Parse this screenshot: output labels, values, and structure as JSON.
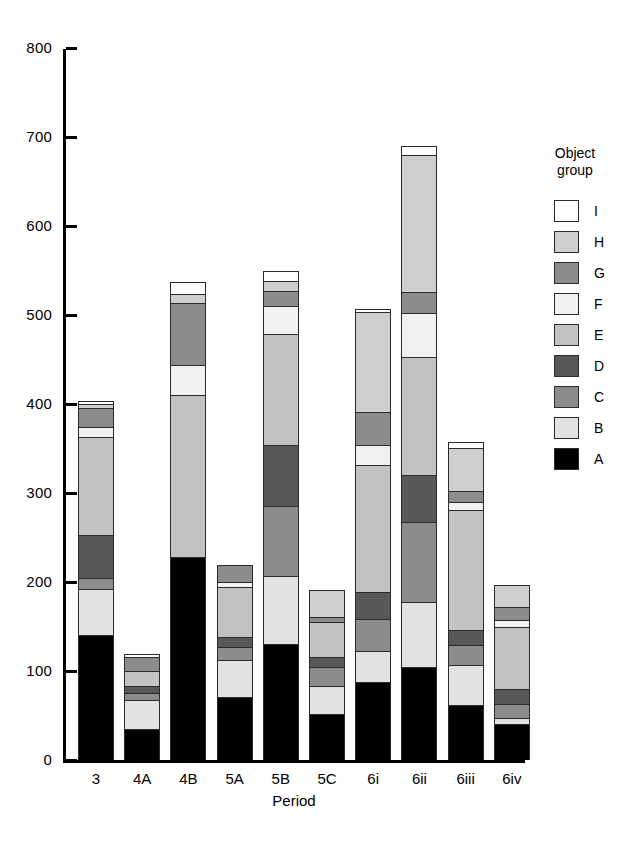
{
  "chart_data": {
    "type": "bar",
    "subtype": "stacked-bar",
    "title": "",
    "xlabel": "Period",
    "ylabel": "",
    "ylim": [
      0,
      800
    ],
    "yticks": [
      0,
      100,
      200,
      300,
      400,
      500,
      600,
      700,
      800
    ],
    "ytick_labels": [
      "0",
      "100",
      "200",
      "300",
      "400",
      "500",
      "600",
      "700",
      "800"
    ],
    "grid": false,
    "legend_title": "Object group",
    "legend_position": "right",
    "legend_order_top_to_bottom": [
      "I",
      "H",
      "G",
      "F",
      "E",
      "D",
      "C",
      "B",
      "A"
    ],
    "categories": [
      "3",
      "4A",
      "4B",
      "5A",
      "5B",
      "5C",
      "6i",
      "6ii",
      "6iii",
      "6iv"
    ],
    "stack_order_bottom_to_top": [
      "A",
      "B",
      "C",
      "D",
      "E",
      "F",
      "G",
      "H",
      "I"
    ],
    "series": [
      {
        "name": "A",
        "color": "#000000",
        "values": [
          140,
          35,
          228,
          71,
          130,
          52,
          88,
          104,
          62,
          41
        ]
      },
      {
        "name": "B",
        "color": "#e2e2e2",
        "values": [
          52,
          33,
          0,
          41,
          77,
          31,
          34,
          73,
          45,
          6
        ]
      },
      {
        "name": "C",
        "color": "#8c8c8c",
        "values": [
          13,
          7,
          0,
          15,
          78,
          22,
          36,
          90,
          22,
          16
        ]
      },
      {
        "name": "D",
        "color": "#585858",
        "values": [
          48,
          8,
          0,
          11,
          69,
          11,
          31,
          53,
          17,
          17
        ]
      },
      {
        "name": "E",
        "color": "#c2c2c2",
        "values": [
          110,
          17,
          182,
          56,
          125,
          39,
          143,
          133,
          135,
          69
        ]
      },
      {
        "name": "F",
        "color": "#f1f1f1",
        "values": [
          11,
          0,
          34,
          6,
          31,
          0,
          22,
          49,
          9,
          8
        ]
      },
      {
        "name": "G",
        "color": "#8c8c8c",
        "values": [
          22,
          16,
          69,
          19,
          17,
          6,
          37,
          24,
          12,
          15
        ]
      },
      {
        "name": "H",
        "color": "#cfcfcf",
        "values": [
          4,
          0,
          11,
          0,
          11,
          30,
          112,
          154,
          49,
          25
        ]
      },
      {
        "name": "I",
        "color": "#ffffff",
        "values": [
          3,
          3,
          13,
          0,
          11,
          0,
          4,
          10,
          6,
          0
        ]
      }
    ],
    "totals": [
      403,
      119,
      537,
      219,
      549,
      191,
      507,
      690,
      357,
      197
    ],
    "bar_tops_total": [
      403,
      119,
      797,
      219,
      600,
      191,
      595,
      800,
      357,
      197
    ]
  },
  "axis": {
    "x_title": "Period",
    "x_labels": [
      "3",
      "4A",
      "4B",
      "5A",
      "5B",
      "5C",
      "6i",
      "6ii",
      "6iii",
      "6iv"
    ],
    "y_labels": [
      "800",
      "700",
      "600",
      "500",
      "400",
      "300",
      "200",
      "100",
      "0"
    ]
  },
  "legend": {
    "title": "Object\ngroup",
    "title_line1": "Object",
    "title_line2": "group",
    "items": [
      {
        "label": "I",
        "color": "#ffffff"
      },
      {
        "label": "H",
        "color": "#cfcfcf"
      },
      {
        "label": "G",
        "color": "#8c8c8c"
      },
      {
        "label": "F",
        "color": "#f1f1f1"
      },
      {
        "label": "E",
        "color": "#c2c2c2"
      },
      {
        "label": "D",
        "color": "#585858"
      },
      {
        "label": "C",
        "color": "#8c8c8c"
      },
      {
        "label": "B",
        "color": "#e2e2e2"
      },
      {
        "label": "A",
        "color": "#000000"
      }
    ]
  }
}
